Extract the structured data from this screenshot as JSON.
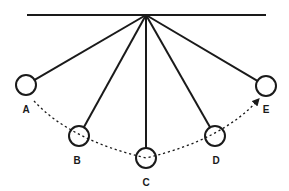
{
  "diagram": {
    "type": "pendulum-swing",
    "colors": {
      "stroke": "#1a1a1a",
      "background": "#ffffff"
    },
    "support_bar": {
      "x1": 27,
      "x2": 266,
      "y": 15
    },
    "pivot": {
      "x": 146,
      "y": 15
    },
    "bob_radius": 10,
    "bobs": [
      {
        "id": "A",
        "label": "A",
        "cx": 26,
        "cy": 85,
        "lx": 26,
        "ly": 113
      },
      {
        "id": "B",
        "label": "B",
        "cx": 79,
        "cy": 136,
        "lx": 77,
        "ly": 164
      },
      {
        "id": "C",
        "label": "C",
        "cx": 146,
        "cy": 158,
        "lx": 146,
        "ly": 186
      },
      {
        "id": "D",
        "label": "D",
        "cx": 215,
        "cy": 136,
        "lx": 216,
        "ly": 164
      },
      {
        "id": "E",
        "label": "E",
        "cx": 266,
        "cy": 86,
        "lx": 266,
        "ly": 113
      }
    ],
    "swing_path": {
      "style": "dashed",
      "direction": "A-to-E",
      "arrow_at": "E"
    }
  }
}
